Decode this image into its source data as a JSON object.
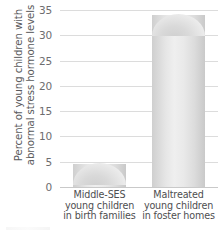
{
  "chart_data": {
    "type": "bar",
    "title": "",
    "xlabel": "",
    "ylabel": "Percent of young children with abnormal stress hormone levels",
    "ylabel_lines": [
      "Percent of young children with",
      "abnormal stress hormone levels"
    ],
    "categories": [
      "Middle-SES young children in birth families",
      "Maltreated young children in foster homes"
    ],
    "category_lines": [
      [
        "Middle-SES",
        "young children",
        "in birth families"
      ],
      [
        "Maltreated",
        "young children",
        "in foster homes"
      ]
    ],
    "values": [
      4.5,
      34
    ],
    "ylim": [
      0,
      35
    ],
    "yticks": [
      0,
      5,
      10,
      15,
      20,
      25,
      30,
      35
    ],
    "ytick_labels": [
      "0",
      "5",
      "10",
      "15",
      "20",
      "25",
      "30",
      "35"
    ],
    "grid": true,
    "legend": false,
    "bar_color": "#e3e3e3",
    "grid_color": "#dcdcdc",
    "text_color": "#58585a"
  }
}
